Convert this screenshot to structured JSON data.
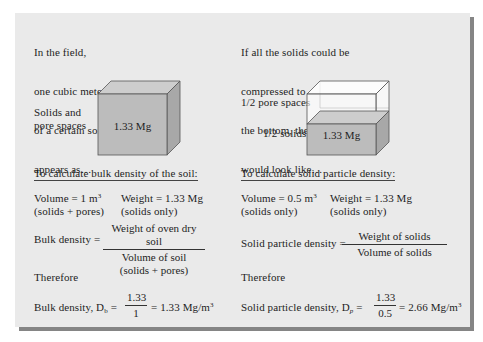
{
  "colors": {
    "panel_bg": "#eaeaea",
    "shadow": "#858585",
    "solid_front": "#bcbcbc",
    "solid_side": "#a8a8a8",
    "solid_top": "#cdcdcd",
    "pore_fill": "#ffffff",
    "outline": "#555555"
  },
  "left": {
    "intro_lines": [
      "In the field,",
      "one cubic meter",
      "of a certain soil",
      "appears as…"
    ],
    "cube_side_label_lines": [
      "Solids and",
      "pore spaces"
    ],
    "cube_mass": "1.33 Mg",
    "heading": "To calculate bulk density of the soil:",
    "volume": {
      "text": "Volume = 1 m",
      "exp": "3",
      "note": "(solids + pores)"
    },
    "weight": {
      "text": "Weight = 1.33 Mg",
      "note": "(solids only)"
    },
    "formula": {
      "label": "Bulk density =",
      "numerator": "Weight of oven dry soil",
      "denominator": "Volume of soil",
      "denominator_note": "(solids + pores)"
    },
    "therefore": "Therefore",
    "result": {
      "label": "Bulk density, D",
      "sub": "b",
      "eq": "=",
      "numerator": "1.33",
      "denominator": "1",
      "value": "= 1.33 Mg/m",
      "exp": "3"
    }
  },
  "right": {
    "intro_lines": [
      "If all the solids could be",
      "compressed to",
      "the bottom, the cube",
      "would look like…"
    ],
    "pore_label": "1/2 pore spaces",
    "solids_label": "1/2 solids",
    "cube_mass": "1.33 Mg",
    "heading": "To calculate solid particle density:",
    "volume": {
      "text": "Volume = 0.5 m",
      "exp": "3",
      "note": "(solids only)"
    },
    "weight": {
      "text": "Weight = 1.33 Mg",
      "note": "(solids only)"
    },
    "formula": {
      "label": "Solid particle density =",
      "numerator": "Weight of solids",
      "denominator": "Volume of solids"
    },
    "therefore": "Therefore",
    "result": {
      "label": "Solid particle density, D",
      "sub": "p",
      "eq": "=",
      "numerator": "1.33",
      "denominator": "0.5",
      "value": "= 2.66 Mg/m",
      "exp": "3"
    }
  }
}
